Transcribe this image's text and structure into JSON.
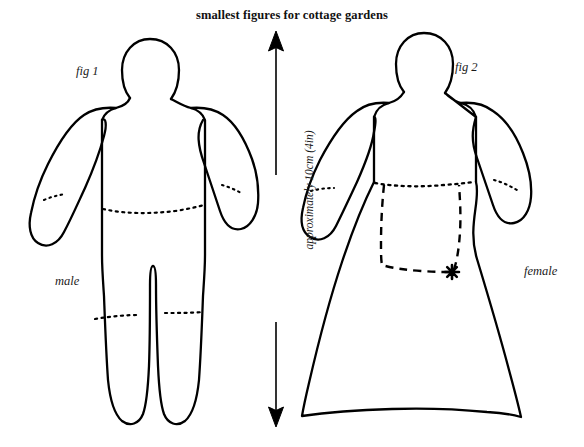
{
  "title": "smallest figures for cottage gardens",
  "figures": [
    {
      "id": "fig1",
      "fig_label": "fig 1",
      "gender_label": "male",
      "parts": [
        "head",
        "body",
        "left-arm",
        "right-arm",
        "legs"
      ],
      "guide_lines": [
        "left-cuff",
        "right-cuff",
        "waist",
        "knees"
      ]
    },
    {
      "id": "fig2",
      "fig_label": "fig 2",
      "gender_label": "female",
      "parts": [
        "head",
        "bodice",
        "left-sleeve",
        "right-sleeve",
        "skirt",
        "apron"
      ],
      "guide_lines": [
        "left-cuff",
        "right-cuff",
        "waist"
      ],
      "marker": "apron-star"
    }
  ],
  "dimension": {
    "label": "approximately 10cm (4in)",
    "arrow": "double-headed-vertical"
  },
  "colors": {
    "ink": "#000000",
    "paper": "#ffffff",
    "text": "#1a1a1a"
  }
}
